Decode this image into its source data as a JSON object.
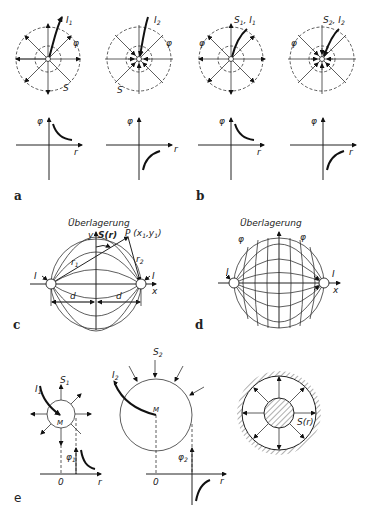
{
  "figure": {
    "panels": [
      {
        "id": "a",
        "label": "a"
      },
      {
        "id": "b",
        "label": "b"
      },
      {
        "id": "c",
        "label": "c"
      },
      {
        "id": "d",
        "label": "d"
      },
      {
        "id": "e",
        "label": "e"
      }
    ],
    "row1": {
      "diagram1": {
        "current": "I",
        "current_sub": "1",
        "potential": "φ",
        "field": "S"
      },
      "diagram2": {
        "current": "I",
        "current_sub": "2",
        "potential": "φ",
        "field": "S"
      },
      "diagram3": {
        "label": "S",
        "label_sub": "1",
        "sep": ", ",
        "current": "I",
        "current_sub": "1",
        "potential": "φ"
      },
      "diagram4": {
        "label": "S",
        "label_sub": "2",
        "sep": ", ",
        "current": "I",
        "current_sub": "2",
        "potential": "φ"
      }
    },
    "graphs": [
      {
        "ylabel": "φ",
        "xlabel": "r",
        "curve": "decreasing-positive"
      },
      {
        "ylabel": "φ",
        "xlabel": "r",
        "curve": "increasing-negative"
      },
      {
        "ylabel": "φ",
        "xlabel": "r",
        "curve": "decreasing-positive"
      },
      {
        "ylabel": "φ",
        "xlabel": "r",
        "curve": "increasing-negative"
      }
    ],
    "c": {
      "title": "Überlagerung",
      "y_axis": "y",
      "field": "S(r)",
      "point": "P (x",
      "point_sub1": "1",
      "point_mid": ",y",
      "point_sub2": "1",
      "point_end": ")",
      "r1": "r",
      "r1_sub": "1",
      "r2": "r",
      "r2_sub": "2",
      "current_left": "I",
      "current_right": "I",
      "x_axis": "x",
      "d_left": "d",
      "d_right": "d"
    },
    "d": {
      "title": "Überlagerung",
      "phi_left": "φ",
      "phi_right": "φ",
      "current_left": "I",
      "current_right": "I",
      "x_axis": "x"
    },
    "e": {
      "s1": "S",
      "s1_sub": "1",
      "i1": "I",
      "i1_sub": "1",
      "m1": "M",
      "phi1": "φ",
      "phi1_sub": "1",
      "zero1": "0",
      "r1": "r",
      "s2": "S",
      "s2_sub": "2",
      "i2": "I",
      "i2_sub": "2",
      "m2": "M",
      "phi2": "φ",
      "phi2_sub": "2",
      "zero2": "0",
      "r2": "r",
      "s3": "S(r)"
    }
  }
}
